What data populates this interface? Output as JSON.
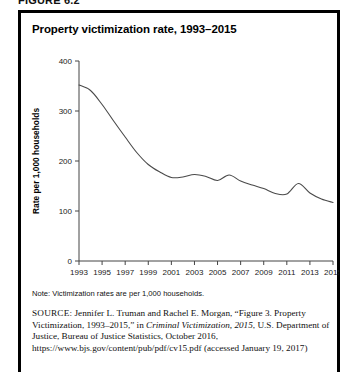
{
  "figure": {
    "label": "FIGURE 6.2",
    "title": "Property victimization rate, 1993–2015"
  },
  "note": {
    "text": "Note: Victimization rates are per 1,000 households."
  },
  "source": {
    "label": "SOURCE:",
    "text_before_italic": " Jennifer L. Truman and Rachel E. Morgan, “Figure 3. Property Victimization, 1993–2015,” in ",
    "italic_title": "Criminal Victimization, 2015",
    "text_after_italic": ", U.S. Department of Justice, Bureau of Justice Statistics, October 2016, https://www.bjs.gov/content/pub/pdf/cv15.pdf (accessed January 19, 2017)"
  },
  "chart_data": {
    "type": "line",
    "title": "Property victimization rate, 1993–2015",
    "xlabel": "",
    "ylabel": "Rate per 1,000 households",
    "ylim": [
      0,
      400
    ],
    "yticks": [
      0,
      100,
      200,
      300,
      400
    ],
    "xlim": [
      1993,
      2015
    ],
    "xticks": [
      1993,
      1995,
      1997,
      1999,
      2001,
      2003,
      2005,
      2007,
      2009,
      2011,
      2013,
      2015
    ],
    "xtick_labels": [
      "1993",
      "1995",
      "1997",
      "1999",
      "2001",
      "2003",
      "2005",
      "2007",
      "2009",
      "2011",
      "2013",
      "2015"
    ],
    "grid": false,
    "legend": false,
    "line_color": "#4a4a4a",
    "x": [
      1993,
      1994,
      1995,
      1996,
      1997,
      1998,
      1999,
      2000,
      2001,
      2002,
      2003,
      2004,
      2005,
      2006,
      2007,
      2008,
      2009,
      2010,
      2011,
      2012,
      2013,
      2014,
      2015
    ],
    "series": [
      {
        "name": "Property victimization rate",
        "values": [
          352,
          341,
          313,
          280,
          248,
          217,
          193,
          178,
          167,
          168,
          173,
          169,
          161,
          172,
          160,
          152,
          145,
          135,
          134,
          155,
          136,
          124,
          117
        ]
      }
    ]
  }
}
